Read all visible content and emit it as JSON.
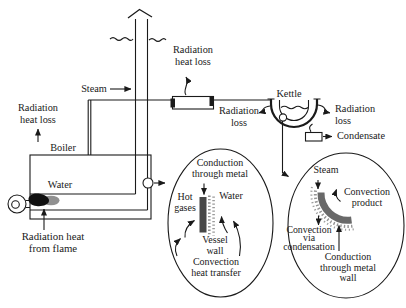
{
  "labels": {
    "radiation_heat_loss_left": {
      "line1": "Radiation",
      "line2": "heat loss"
    },
    "steam_pipe": "Steam",
    "radiation_heat_loss_top": {
      "line1": "Radiation",
      "line2": "heat loss"
    },
    "boiler": "Boiler",
    "water": "Water",
    "kettle": "Kettle",
    "radiation_loss_kettle_left": {
      "line1": "Radiation",
      "line2": "loss"
    },
    "radiation_loss_kettle_right": {
      "line1": "Radiation",
      "line2": "loss"
    },
    "condensate": "Condensate",
    "radiation_heat_from_flame": {
      "line1": "Radiation heat",
      "line2": "from flame"
    },
    "boiler_detail": {
      "conduction": {
        "line1": "Conduction",
        "line2": "through metal"
      },
      "hot_gases": {
        "line1": "Hot",
        "line2": "gases"
      },
      "water": "Water",
      "vessel_wall": {
        "line1": "Vessel",
        "line2": "wall"
      },
      "convection": {
        "line1": "Convection",
        "line2": "heat transfer"
      }
    },
    "kettle_detail": {
      "steam": "Steam",
      "convection_product": {
        "line1": "Convection",
        "line2": "product"
      },
      "convection_via_condensation": {
        "line1": "Convection",
        "line2": "via",
        "line3": "condensation"
      },
      "conduction_wall": {
        "line1": "Conduction",
        "line2": "through metal",
        "line3": "wall"
      }
    }
  },
  "icons": {
    "flame": "flame-icon",
    "burner": "burner-icon",
    "steam_vent": "steam-vent-chevron-icon",
    "arrows": "arrowhead-icon"
  },
  "colors": {
    "ink": "#1a1a1a",
    "background": "#ffffff",
    "flame_core": "#101010",
    "flame_smoke": "#7d7d7d",
    "vessel_wall_fill": "#474747",
    "kettle_wall_band": "#696969",
    "speckle": "#949494"
  }
}
